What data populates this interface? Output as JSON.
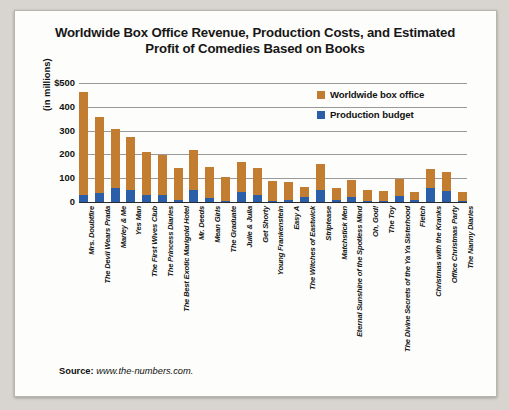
{
  "figure": {
    "title": "Worldwide Box Office Revenue, Production Costs, and Estimated Profit of Comedies Based on Books",
    "source_label": "Source:",
    "source_value": "www.the-numbers.com."
  },
  "legend": {
    "items": [
      {
        "label": "Worldwide box office",
        "color": "#c27d30"
      },
      {
        "label": "Production budget",
        "color": "#2a5ea8"
      }
    ]
  },
  "axis": {
    "ylabel": "(in millions)",
    "yticks": [
      "$500",
      "400",
      "300",
      "200",
      "100",
      "0"
    ]
  },
  "chart_data": {
    "type": "bar",
    "title": "Worldwide Box Office Revenue, Production Costs, and Estimated Profit of Comedies Based on Books",
    "xlabel": "",
    "ylabel": "(in millions)",
    "ylim": [
      0,
      500
    ],
    "grid": true,
    "stacked": true,
    "legend_position": "top-right",
    "categories": [
      "Mrs. Doubtfire",
      "The Devil Wears Prada",
      "Marley & Me",
      "Yes Man",
      "The First Wives Club",
      "The Princess Diaries",
      "The Best Exotic Marigold Hotel",
      "Mr. Deeds",
      "Mean Girls",
      "The Graduate",
      "Julie & Julia",
      "Get Shorty",
      "Young Frankenstein",
      "Easy A",
      "The Witches of Eastwick",
      "Striptease",
      "Matchstick Men",
      "Eternal Sunshine of the Spotless Mind",
      "Oh, God!",
      "The Toy",
      "The Divine Secrets of the Ya Ya Sisterhood",
      "Fletch",
      "Christmas with the Kranks",
      "Office Christmas Party",
      "The Nanny Diaries"
    ],
    "series": [
      {
        "name": "Worldwide box office",
        "color": "#c27d30",
        "values": [
          461,
          357,
          306,
          274,
          209,
          197,
          145,
          218,
          148,
          104,
          169,
          143,
          88,
          84,
          63,
          160,
          58,
          93,
          49,
          45,
          96,
          44,
          140,
          128,
          42
        ]
      },
      {
        "name": "Production budget",
        "color": "#2a5ea8",
        "values": [
          28,
          37,
          60,
          50,
          30,
          30,
          10,
          50,
          17,
          3,
          40,
          30,
          3,
          8,
          22,
          50,
          10,
          20,
          3,
          3,
          27,
          8,
          60,
          45,
          3
        ]
      }
    ]
  }
}
